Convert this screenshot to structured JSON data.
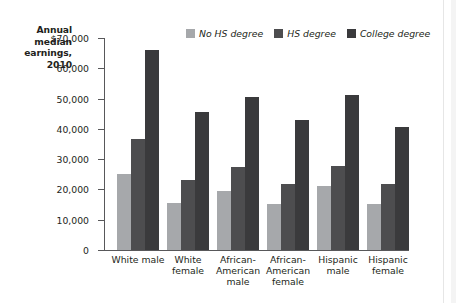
{
  "title": {
    "lines": [
      "Annual",
      "median",
      "earnings,",
      "2010"
    ]
  },
  "legend": {
    "position": "top-center",
    "items": [
      {
        "label": "No HS degree",
        "color": "#a6a8ab"
      },
      {
        "label": "HS degree",
        "color": "#4d4d4f"
      },
      {
        "label": "College degree",
        "color": "#3a3a3c"
      }
    ]
  },
  "axis": {
    "y_tick_labels": [
      "$70,000",
      "60,000",
      "50,000",
      "40,000",
      "30,000",
      "20,000",
      "10,000",
      "0"
    ],
    "y_tick_values": [
      70000,
      60000,
      50000,
      40000,
      30000,
      20000,
      10000,
      0
    ]
  },
  "chart_data": {
    "type": "bar",
    "title": "Annual median earnings, 2010",
    "xlabel": "",
    "ylabel": "Annual median earnings, 2010",
    "ylim": [
      0,
      70000
    ],
    "grid": false,
    "legend_position": "top-center",
    "categories": [
      "White male",
      "White female",
      "African-American male",
      "African-American female",
      "Hispanic male",
      "Hispanic female"
    ],
    "series": [
      {
        "name": "No HS degree",
        "color": "#a6a8ab",
        "values": [
          25200,
          15600,
          19600,
          15300,
          21300,
          15200
        ]
      },
      {
        "name": "HS degree",
        "color": "#4d4d4f",
        "values": [
          36800,
          23200,
          27500,
          21800,
          27900,
          21700
        ]
      },
      {
        "name": "College degree",
        "color": "#3a3a3c",
        "values": [
          66200,
          45600,
          50600,
          43000,
          51300,
          40600
        ]
      }
    ]
  }
}
